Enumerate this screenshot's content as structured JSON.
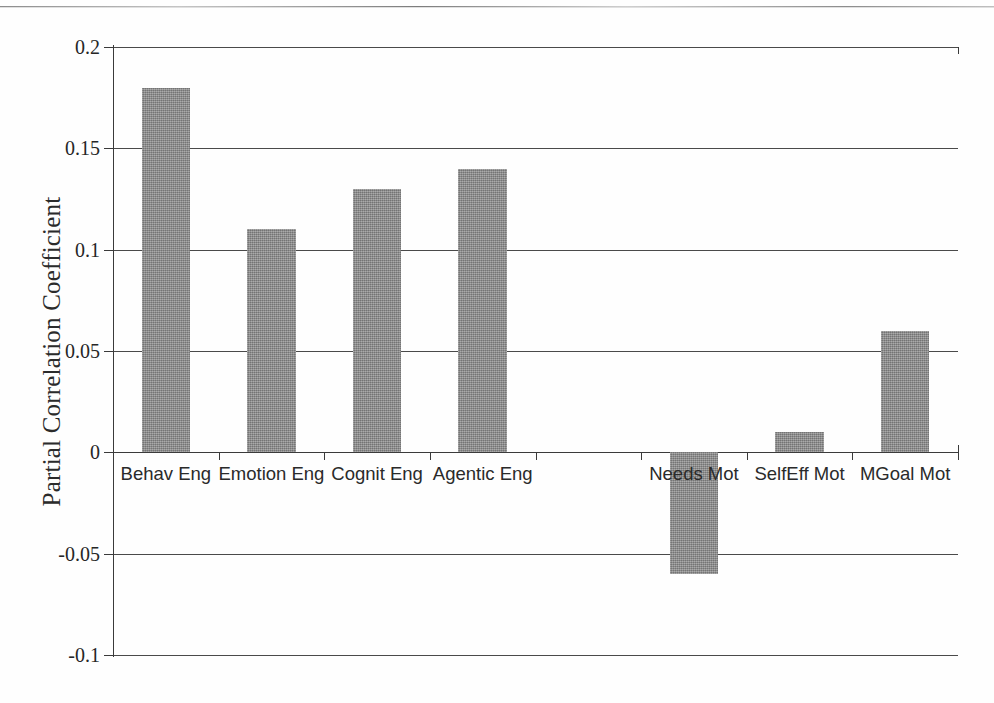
{
  "chart_data": {
    "type": "bar",
    "title": "",
    "xlabel": "",
    "ylabel": "Partial Correlation Coefficient",
    "categories": [
      "Behav Eng",
      "Emotion Eng",
      "Cognit Eng",
      "Agentic Eng",
      "",
      "Needs Mot",
      "SelfEff Mot",
      "MGoal Mot"
    ],
    "values": [
      0.18,
      0.11,
      0.13,
      0.14,
      null,
      -0.06,
      0.01,
      0.06
    ],
    "ylim": [
      -0.1,
      0.2
    ],
    "ytick_values": [
      0.2,
      0.15,
      0.1,
      0.05,
      0,
      -0.05,
      -0.1
    ],
    "ytick_labels": [
      "0.2",
      "0.15",
      "0.1",
      "0.05",
      "0",
      "-0.05",
      "-0.1"
    ],
    "grid": true,
    "legend": false,
    "bar_color": "#8e8e8e",
    "axis_color": "#3a3a3a"
  }
}
